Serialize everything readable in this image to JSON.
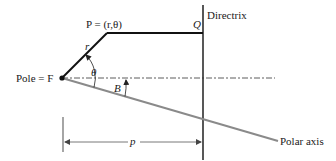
{
  "diagram": {
    "type": "polar-conic-geometry",
    "labels": {
      "point": "P = (r,θ)",
      "point_q": "Q",
      "directrix": "Directrix",
      "radius": "r",
      "angle_theta": "θ",
      "angle_b": "B",
      "pole": "Pole = F",
      "distance": "p",
      "polar_axis": "Polar axis"
    },
    "colors": {
      "line": "#111111",
      "axis": "#8a8a8a",
      "dashed": "#333333",
      "dimension": "#6a6a6a"
    },
    "points": {
      "F": [
        62,
        78
      ],
      "P": [
        107,
        33
      ],
      "Q": [
        203,
        33
      ],
      "directrix_top": [
        203,
        5
      ],
      "directrix_bottom": [
        203,
        160
      ],
      "axis_end": [
        278,
        141
      ],
      "dashed_end": [
        275,
        78
      ]
    }
  }
}
